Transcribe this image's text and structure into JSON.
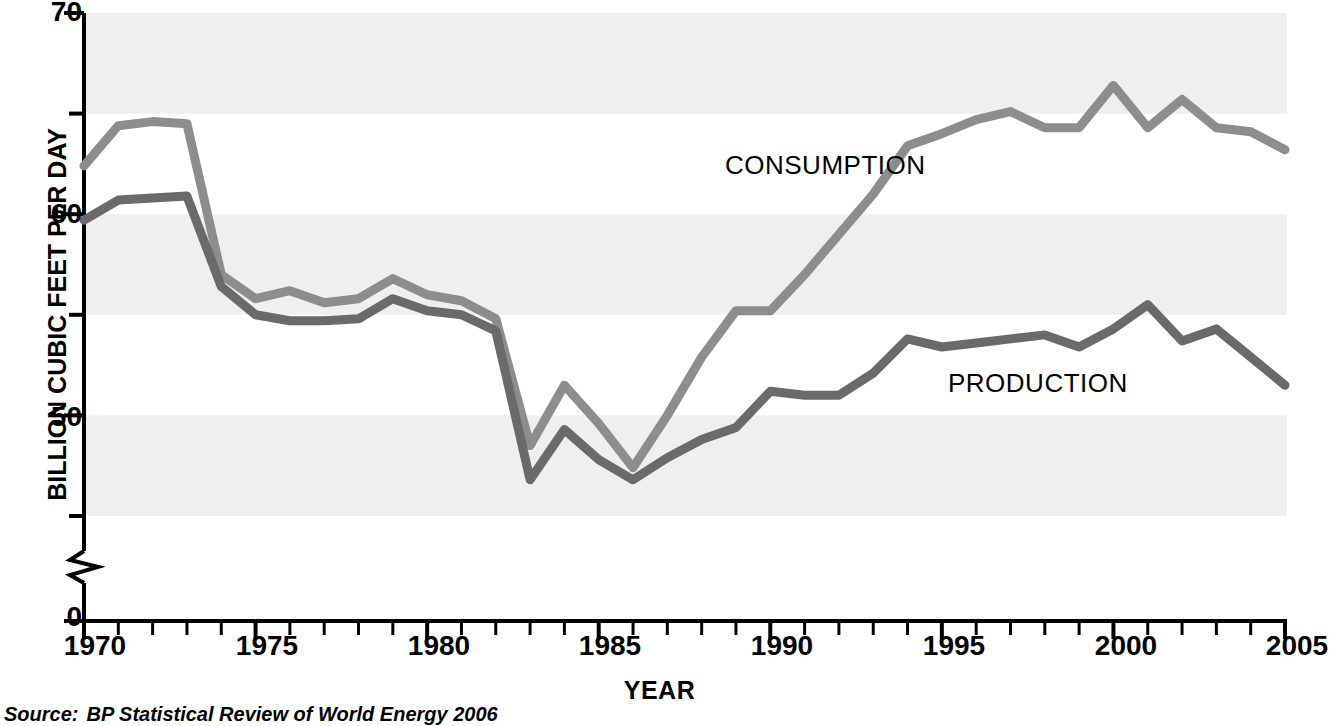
{
  "axes": {
    "y_title": "BILLION CUBIC FEET PER DAY",
    "x_title": "YEAR",
    "y_tick_labels": [
      "70",
      "60",
      "50",
      "0"
    ],
    "x_tick_labels": [
      "1970",
      "1975",
      "1980",
      "1985",
      "1990",
      "1995",
      "2000",
      "2005"
    ]
  },
  "labels": {
    "consumption": "CONSUMPTION",
    "production": "PRODUCTION"
  },
  "source": {
    "lead": "Source:",
    "text": "BP Statistical Review of World Energy 2006"
  },
  "colors": {
    "consumption": "#8d8d8d",
    "production": "#6a6a6a",
    "band": "#efefef",
    "axis": "#000000",
    "background": "#ffffff"
  },
  "chart_data": {
    "type": "line",
    "title": "",
    "xlabel": "YEAR",
    "ylabel": "BILLION CUBIC FEET PER DAY",
    "xlim": [
      1970,
      2005
    ],
    "ylim": [
      45,
      70
    ],
    "y_axis_break": true,
    "y_break_from": 0,
    "y_break_to": 45,
    "y_major_ticks": [
      70,
      60,
      50,
      0
    ],
    "y_minor_ticks": [
      65,
      55,
      45
    ],
    "x_tick_interval": 1,
    "x_label_interval": 5,
    "grid": "horizontal-bands",
    "band_ranges": [
      [
        65,
        70
      ],
      [
        55,
        60
      ],
      [
        45,
        50
      ]
    ],
    "legend": "inline-labels",
    "x": [
      1970,
      1971,
      1972,
      1973,
      1974,
      1975,
      1976,
      1977,
      1978,
      1979,
      1980,
      1981,
      1982,
      1983,
      1984,
      1985,
      1986,
      1987,
      1988,
      1989,
      1990,
      1991,
      1992,
      1993,
      1994,
      1995,
      1996,
      1997,
      1998,
      1999,
      2000,
      2001,
      2002,
      2003,
      2004,
      2005
    ],
    "series": [
      {
        "name": "CONSUMPTION",
        "color": "#8d8d8d",
        "values": [
          62.4,
          64.4,
          64.6,
          64.5,
          57.0,
          55.8,
          56.2,
          55.6,
          55.8,
          56.8,
          56.0,
          55.7,
          54.8,
          48.5,
          51.5,
          49.6,
          47.4,
          50.0,
          52.9,
          55.2,
          55.2,
          57.0,
          59.0,
          61.0,
          63.4,
          64.0,
          64.7,
          65.1,
          64.3,
          64.3,
          66.4,
          64.3,
          65.7,
          64.3,
          64.1,
          63.2
        ]
      },
      {
        "name": "PRODUCTION",
        "color": "#6a6a6a",
        "values": [
          59.7,
          60.7,
          60.8,
          60.9,
          56.4,
          55.0,
          54.7,
          54.7,
          54.8,
          55.8,
          55.2,
          55.0,
          54.2,
          46.8,
          49.3,
          47.8,
          46.8,
          47.9,
          48.8,
          49.4,
          51.2,
          51.0,
          51.0,
          52.1,
          53.8,
          53.4,
          53.6,
          53.8,
          54.0,
          53.4,
          54.3,
          55.5,
          53.7,
          54.3,
          52.9,
          51.5
        ]
      }
    ]
  }
}
